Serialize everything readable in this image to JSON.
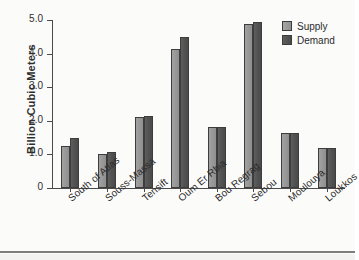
{
  "chart_data": {
    "type": "bar",
    "title": "",
    "xlabel": "",
    "ylabel": "Billion Cubic Meters",
    "categories": [
      "South of Atlas",
      "Souss-Massa",
      "Tensift",
      "Oum Er Rbia",
      "Bou Regrag",
      "Sebou",
      "Moulouya",
      "Loukkos"
    ],
    "series": [
      {
        "name": "Supply",
        "color": "#9a9a9a",
        "values": [
          1.25,
          1.0,
          2.1,
          4.13,
          1.82,
          4.87,
          1.63,
          1.2
        ]
      },
      {
        "name": "Demand",
        "color": "#4f4f4f",
        "values": [
          1.5,
          1.06,
          2.15,
          4.5,
          1.82,
          4.95,
          1.63,
          1.2
        ]
      }
    ],
    "ylim": [
      0,
      5.0
    ],
    "ytick_labels": [
      "0",
      "1.0",
      "2.0",
      "3.0",
      "4.0",
      "5.0"
    ],
    "ytick_values": [
      0,
      1.0,
      2.0,
      3.0,
      4.0,
      5.0
    ],
    "grid": false,
    "legend_position": "top-right"
  },
  "legend": {
    "entries": [
      {
        "label": "Supply"
      },
      {
        "label": "Demand"
      }
    ]
  }
}
